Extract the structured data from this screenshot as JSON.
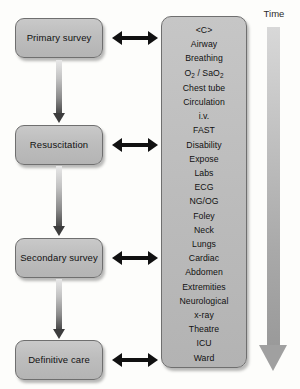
{
  "stages": [
    {
      "label": "Primary survey"
    },
    {
      "label": "Resuscitation"
    },
    {
      "label": "Secondary survey"
    },
    {
      "label": "Definitive care"
    }
  ],
  "checklist": {
    "items": [
      {
        "text": "<C>"
      },
      {
        "text": "Airway"
      },
      {
        "text": "Breathing"
      },
      {
        "text": "O2 / SaO2",
        "html": "O<sub>2</sub> / SaO<sub>2</sub>"
      },
      {
        "text": "Chest tube"
      },
      {
        "text": "Circulation"
      },
      {
        "text": "i.v."
      },
      {
        "text": "FAST"
      },
      {
        "text": "Disability"
      },
      {
        "text": "Expose"
      },
      {
        "text": "Labs"
      },
      {
        "text": "ECG"
      },
      {
        "text": "NG/OG"
      },
      {
        "text": "Foley"
      },
      {
        "text": "Neck"
      },
      {
        "text": "Lungs"
      },
      {
        "text": "Cardiac"
      },
      {
        "text": "Abdomen"
      },
      {
        "text": "Extremities"
      },
      {
        "text": "Neurological"
      },
      {
        "text": "x-ray"
      },
      {
        "text": "Theatre"
      },
      {
        "text": "ICU"
      },
      {
        "text": "Ward"
      }
    ]
  },
  "time_axis": {
    "label": "Time"
  },
  "colors": {
    "box_fill": "#bdbdbd",
    "box_border": "#6f6f6f",
    "link_arrow": "#111111",
    "time_arrow": "#a0a0a0",
    "background": "#fdfdfb"
  }
}
